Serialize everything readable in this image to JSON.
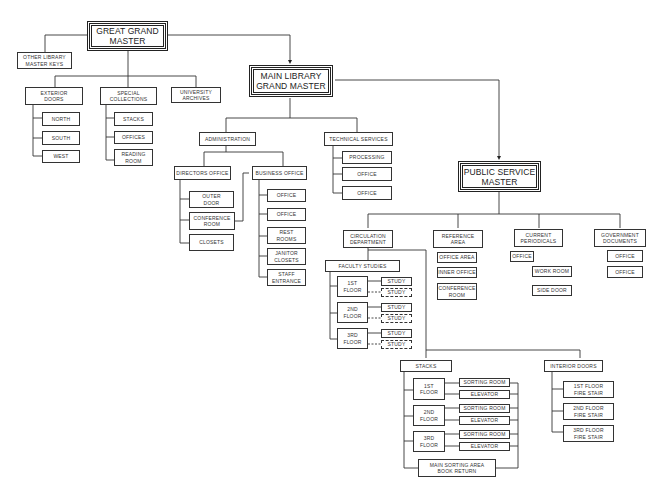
{
  "diagram": {
    "nodes": {
      "great_grand_master": "GREAT GRAND\nMASTER",
      "other_library_master_keys": "OTHER LIBRARY\nMASTER KEYS",
      "exterior_doors": "EXTERIOR\nDOORS",
      "north": "NORTH",
      "south": "SOUTH",
      "west": "WEST",
      "special_collections": "SPECIAL\nCOLLECTIONS",
      "stacks_sc": "STACKS",
      "offices_sc": "OFFICES",
      "reading_room": "READING\nROOM",
      "university_archives": "UNIVERSITY\nARCHIVES",
      "main_library_grand_master": "MAIN LIBRARY\nGRAND MASTER",
      "administration": "ADMINISTRATION",
      "directors_office": "DIRECTORS OFFICE",
      "outer_door": "OUTER\nDOOR",
      "conference_room_admin": "CONFERENCE\nROOM",
      "closets": "CLOSETS",
      "business_office": "BUSINESS OFFICE",
      "bo_office_1": "OFFICE",
      "bo_office_2": "OFFICE",
      "rest_rooms": "REST\nROOMS",
      "janitor_closets": "JANITOR\nCLOSETS",
      "staff_entrance": "STAFF\nENTRANCE",
      "technical_services": "TECHNICAL SERVICES",
      "processing": "PROCESSING",
      "ts_office_1": "OFFICE",
      "ts_office_2": "OFFICE",
      "public_service_master": "PUBLIC SERVICE\nMASTER",
      "circulation_department": "CIRCULATION\nDEPARTMENT",
      "faculty_studies": "FACULTY STUDIES",
      "fs_1st_floor": "1st\nFLOOR",
      "fs_2nd_floor": "2nd\nFLOOR",
      "fs_3rd_floor": "3rd\nFLOOR",
      "study": "STUDY",
      "reference_area": "REFERENCE\nAREA",
      "office_area": "OFFICE AREA",
      "inner_office": "INNER OFFICE",
      "conference_room_ref": "CONFERENCE\nROOM",
      "current_periodicals": "CURRENT\nPERIODICALS",
      "cp_office": "OFFICE",
      "work_room": "WORK ROOM",
      "side_door": "SIDE DOOR",
      "government_documents": "GOVERNMENT\nDOCUMENTS",
      "gd_office_1": "OFFICE",
      "gd_office_2": "OFFICE",
      "stacks": "STACKS",
      "st_1st_floor": "1st\nFLOOR",
      "st_2nd_floor": "2nd\nFLOOR",
      "st_3rd_floor": "3rd\nFLOOR",
      "sorting_room": "SORTING ROOM",
      "elevator": "ELEVATOR",
      "main_sorting_area": "MAIN SORTING AREA\nBOOK RETURN",
      "interior_doors": "INTERIOR DOORS",
      "fire_stair_1": "1st FLOOR\nFIRE STAIR",
      "fire_stair_2": "2nd FLOOR\nFIRE STAIR",
      "fire_stair_3": "3rd FLOOR\nFIRE STAIR"
    }
  }
}
